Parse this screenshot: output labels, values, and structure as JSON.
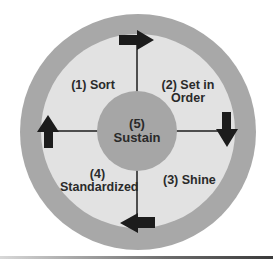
{
  "diagram": {
    "colors": {
      "outer_ring": "#a8a8a8",
      "inner_field": "#e2e2e2",
      "center_circle": "#a6a6a6",
      "arrows": "#1c1c1c",
      "text": "#2a2a2a"
    },
    "center": {
      "number": "(5)",
      "label": "Sustain"
    },
    "quadrants": [
      {
        "position": "top-left",
        "line1": "(1) Sort",
        "line2": ""
      },
      {
        "position": "top-right",
        "line1": "(2) Set in",
        "line2": "Order"
      },
      {
        "position": "bottom-right",
        "line1": "(3) Shine",
        "line2": ""
      },
      {
        "position": "bottom-left",
        "line1": "(4)",
        "line2": "Standardized"
      }
    ],
    "arrows": [
      {
        "name": "top-arrow",
        "direction": "right"
      },
      {
        "name": "right-arrow",
        "direction": "down"
      },
      {
        "name": "bottom-arrow",
        "direction": "left"
      },
      {
        "name": "left-arrow",
        "direction": "up"
      }
    ]
  }
}
